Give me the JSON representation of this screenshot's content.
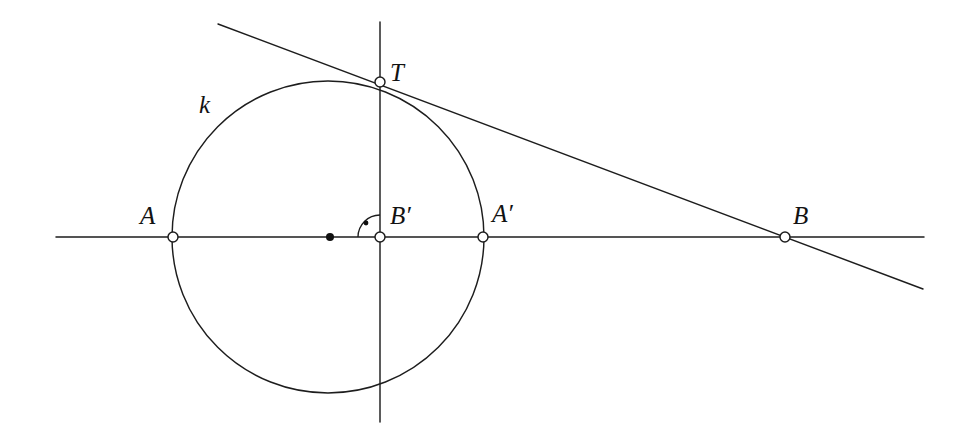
{
  "figure": {
    "width": 967,
    "height": 442,
    "background_color": "#ffffff",
    "stroke_color": "#1d1d1d"
  },
  "labels": {
    "circle": "k",
    "tangent_point": "T",
    "point_a": "A",
    "point_a_prime": "A′",
    "point_b_prime": "B′",
    "point_b": "B"
  },
  "geometry": {
    "circle": {
      "cx": 328,
      "cy": 237,
      "r": 156
    },
    "horizontal_line": {
      "x1": 56,
      "y1": 237,
      "x2": 924,
      "y2": 237
    },
    "vertical_line": {
      "x1": 380,
      "y1": 22,
      "x2": 380,
      "y2": 422
    },
    "tangent_line": {
      "x1": 218,
      "y1": 24,
      "x2": 923,
      "y2": 289
    },
    "points": {
      "A": {
        "x": 173,
        "y": 237,
        "style": "open"
      },
      "A_prime": {
        "x": 483,
        "y": 237,
        "style": "open"
      },
      "B_prime": {
        "x": 380,
        "y": 237,
        "style": "open"
      },
      "B": {
        "x": 785,
        "y": 237,
        "style": "open"
      },
      "T": {
        "x": 380,
        "y": 82,
        "style": "open"
      },
      "center": {
        "x": 330,
        "y": 237,
        "style": "filled"
      }
    },
    "right_angle_marker": {
      "at": "B_prime",
      "radius": 22,
      "quadrant": "upper-left",
      "dot": {
        "x": 365,
        "y": 222
      }
    }
  }
}
